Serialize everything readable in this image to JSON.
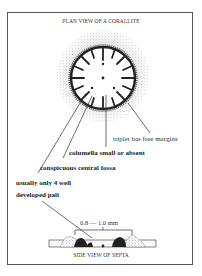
{
  "figure": {
    "title_top": "PLAN VIEW OF A CORALLITE",
    "title_bottom": "SIDE VIEW OF SEPTA",
    "labels": {
      "triplet": "triplet has free margins",
      "columella": "columella small or absent",
      "fossa": "conspicuous central fossa",
      "pali_line1": "usually only 4 well",
      "pali_line2": "developed pali"
    },
    "dimension": "0.8 — 1.0 mm"
  }
}
